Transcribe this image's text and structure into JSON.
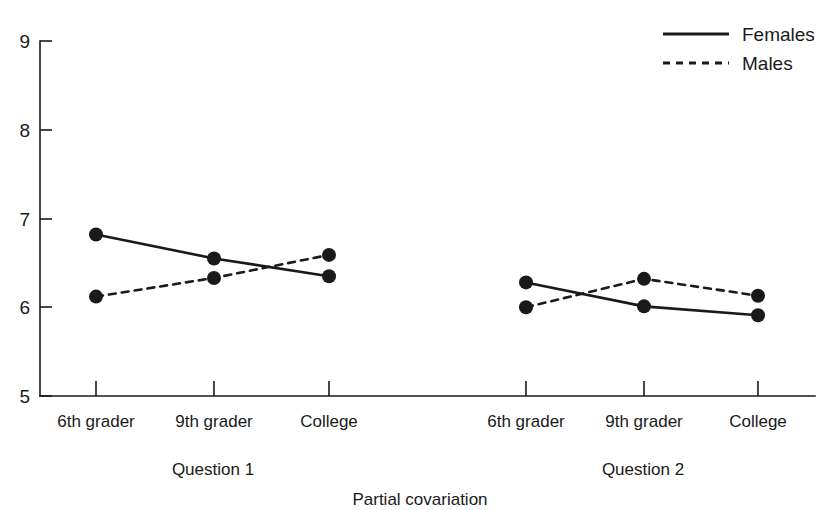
{
  "chart_data": {
    "type": "line",
    "title": "",
    "subtitle": "",
    "xlabel": "Partial covariation",
    "ylabel": "",
    "ylim": [
      5,
      9
    ],
    "yticks": [
      5,
      6,
      7,
      8,
      9
    ],
    "ytick_labels": [
      "5",
      "6",
      "7",
      "8",
      "9"
    ],
    "grid": false,
    "legend_position": "top-right",
    "categories": [
      "6th grader",
      "9th grader",
      "College"
    ],
    "groups": [
      {
        "name": "Question 1",
        "categories": [
          "6th grader",
          "9th grader",
          "College"
        ]
      },
      {
        "name": "Question 2",
        "categories": [
          "6th grader",
          "9th grader",
          "College"
        ]
      }
    ],
    "series": [
      {
        "name": "Females",
        "line_style": "solid",
        "marker": "filled-circle",
        "color": "#1a1a1a",
        "values_question_1": [
          6.82,
          6.55,
          6.35
        ],
        "values_question_2": [
          6.28,
          6.01,
          5.91
        ]
      },
      {
        "name": "Males",
        "line_style": "dashed",
        "marker": "filled-circle",
        "color": "#1a1a1a",
        "values_question_1": [
          6.12,
          6.33,
          6.59
        ],
        "values_question_2": [
          6.0,
          6.32,
          6.13
        ]
      }
    ],
    "legend": [
      {
        "label": "Females",
        "line_style": "solid"
      },
      {
        "label": "Males",
        "line_style": "dashed"
      }
    ]
  },
  "axes": {
    "y_tick_labels": [
      "9",
      "8",
      "7",
      "6",
      "5"
    ],
    "x_tick_labels_q1": [
      "6th grader",
      "9th grader",
      "College"
    ],
    "x_tick_labels_q2": [
      "6th grader",
      "9th grader",
      "College"
    ],
    "group_label_q1": "Question 1",
    "group_label_q2": "Question 2",
    "x_axis_title": "Partial covariation"
  },
  "legend": {
    "females_label": "Females",
    "males_label": "Males"
  },
  "style": {
    "ink": "#1a1a1a",
    "background": "#ffffff"
  }
}
